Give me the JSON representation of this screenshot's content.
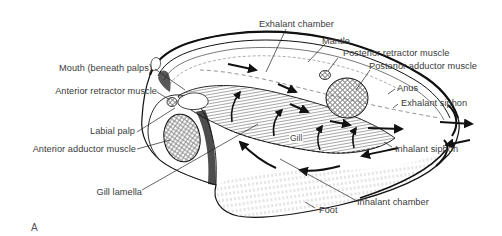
{
  "figure": {
    "panel_letter": "A",
    "labels": {
      "exhalant_chamber": "Exhalant chamber",
      "mantle": "Mantle",
      "posterior_retractor_muscle": "Posterior retractor muscle",
      "posterior_adductor_muscle": "Posterior adductor muscle",
      "anus": "Anus",
      "exhalant_siphon": "Exhalant siphon",
      "inhalant_siphon": "Inhalant siphon",
      "inhalant_chamber": "Inhalant chamber",
      "foot": "Foot",
      "gill": "Gill",
      "gill_lamella": "Gill lamella",
      "anterior_adductor_muscle": "Anterior adductor muscle",
      "labial_palp": "Labial palp",
      "anterior_retractor_muscle": "Anterior retractor muscle",
      "mouth": "Mouth (beneath palps)"
    },
    "colors": {
      "ink": "#1a1a1a",
      "label_text": "#3a3a3a",
      "background": "#ffffff"
    }
  }
}
